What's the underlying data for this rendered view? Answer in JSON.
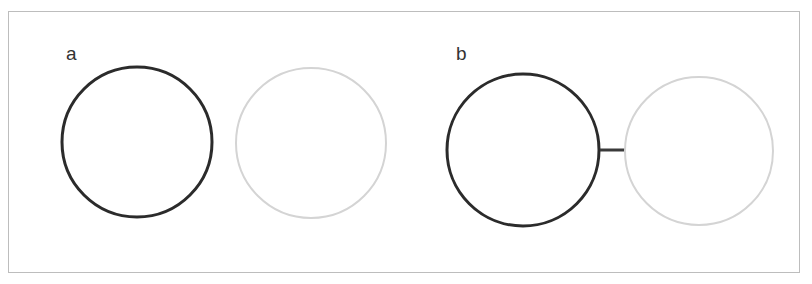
{
  "figure": {
    "panels": [
      {
        "label": "a",
        "label_pos": {
          "x": 66,
          "y": 44
        },
        "circles": [
          {
            "role": "dark",
            "cx": 137,
            "cy": 142,
            "r": 75,
            "stroke": "#2b2b2b",
            "stroke_width": 3
          },
          {
            "role": "light",
            "cx": 311,
            "cy": 143,
            "r": 75,
            "stroke": "#d4d4d4",
            "stroke_width": 2
          }
        ],
        "connector": null
      },
      {
        "label": "b",
        "label_pos": {
          "x": 456,
          "y": 44
        },
        "circles": [
          {
            "role": "dark",
            "cx": 523,
            "cy": 150,
            "r": 76,
            "stroke": "#2b2b2b",
            "stroke_width": 3
          },
          {
            "role": "light",
            "cx": 699,
            "cy": 151,
            "r": 74,
            "stroke": "#d4d4d4",
            "stroke_width": 2
          }
        ],
        "connector": {
          "x1": 600,
          "y1": 150,
          "x2": 625,
          "y2": 150,
          "stroke": "#3a3a3a",
          "stroke_width": 3
        }
      }
    ]
  },
  "colors": {
    "frame_border": "#bdbdbd",
    "dark_stroke": "#2b2b2b",
    "light_stroke": "#d4d4d4",
    "label_text": "#333333"
  }
}
